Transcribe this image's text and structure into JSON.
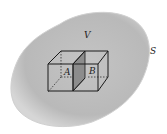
{
  "diagram": {
    "labels": {
      "volume": "V",
      "surface": "S",
      "cell_a": "A",
      "cell_b": "B"
    },
    "colors": {
      "blob_fill": "#bdbdbd",
      "blob_edge": "#d8d8d8",
      "shared_face": "#8c8c8c",
      "lines": "#1a1a1a"
    }
  }
}
